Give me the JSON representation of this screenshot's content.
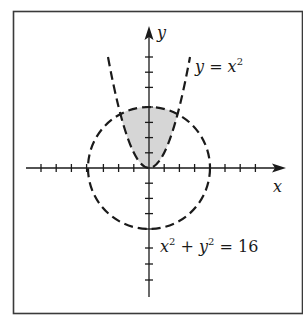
{
  "figure": {
    "frame": {
      "present": true,
      "stroke": "#333333"
    },
    "axes": {
      "x_label": "x",
      "y_label": "y",
      "x_range": [
        -8,
        8
      ],
      "y_range": [
        -8,
        9
      ],
      "tick_spacing": 1,
      "x_ticks": [
        -7,
        -6,
        -5,
        -4,
        -3,
        -2,
        -1,
        1,
        2,
        3,
        4,
        5,
        6,
        7
      ],
      "y_ticks": [
        -8,
        -7,
        -6,
        -5,
        -4,
        -3,
        -2,
        -1,
        1,
        2,
        3,
        4,
        5,
        6,
        7
      ]
    },
    "curves": [
      {
        "name": "parabola",
        "equation_label": "y = x",
        "superscript": "2",
        "style": "dashed",
        "color": "#1a1a1a"
      },
      {
        "name": "circle",
        "equation_label_parts": [
          "x",
          "2",
          " + y",
          "2",
          " = 16"
        ],
        "style": "dashed",
        "color": "#1a1a1a",
        "radius": 4
      }
    ],
    "shaded_region": {
      "description": "Region inside circle x^2 + y^2 = 16 and above parabola y = x^2",
      "fill": "#d6d6d6"
    }
  },
  "labels": {
    "x_axis": "x",
    "y_axis": "y",
    "parabola_base": "y = x",
    "parabola_exp": "2",
    "circle_x": "x",
    "circle_x_exp": "2",
    "circle_plus_y": " + y",
    "circle_y_exp": "2",
    "circle_rhs": " = 16"
  }
}
